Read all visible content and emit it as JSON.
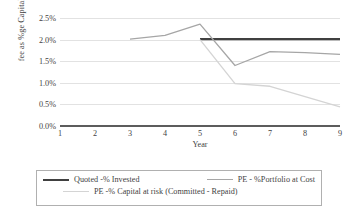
{
  "chart_data": {
    "type": "line",
    "title": "",
    "xlabel": "Year",
    "ylabel": "fee as %ge Capital Invested",
    "x": [
      1,
      2,
      3,
      4,
      5,
      6,
      7,
      8,
      9
    ],
    "xticklabels": [
      "1",
      "2",
      "3",
      "4",
      "5",
      "6",
      "7",
      "8",
      "9"
    ],
    "yticklabels": [
      "0.0%",
      "0.5%",
      "1.0%",
      "1.5%",
      "2.0%",
      "2.5%"
    ],
    "ytickvalues": [
      0.0,
      0.5,
      1.0,
      1.5,
      2.0,
      2.5
    ],
    "ylim": [
      0.0,
      2.5
    ],
    "xlim": [
      1,
      9
    ],
    "grid": true,
    "legend_position": "bottom",
    "series": [
      {
        "name": "Quoted -% Invested",
        "color": "#404040",
        "width": 2.1,
        "x": [
          5,
          6,
          7,
          8,
          9
        ],
        "values": [
          2.01,
          2.01,
          2.01,
          2.01,
          2.01
        ]
      },
      {
        "name": "PE - %Portfolio at Cost",
        "color": "#a6a6a6",
        "width": 1.3,
        "x": [
          3,
          4,
          5,
          6,
          7,
          8,
          9
        ],
        "values": [
          2.01,
          2.1,
          2.36,
          1.4,
          1.72,
          1.7,
          1.66
        ]
      },
      {
        "name": "PE -% Capital at risk (Committed - Repaid)",
        "color": "#d4d4d4",
        "width": 1.3,
        "x": [
          5,
          6,
          7,
          8,
          9
        ],
        "values": [
          2.0,
          0.98,
          0.92,
          0.68,
          0.44
        ]
      }
    ]
  },
  "axis": {
    "y_title": "fee as %ge Capital Invested",
    "x_title": "Year"
  },
  "legend": {
    "items": [
      {
        "label": "Quoted -% Invested",
        "swatch": "dark"
      },
      {
        "label": "PE - %Portfolio at Cost",
        "swatch": "mid"
      },
      {
        "label": "PE -% Capital at risk (Committed - Repaid)",
        "swatch": "light"
      }
    ]
  }
}
